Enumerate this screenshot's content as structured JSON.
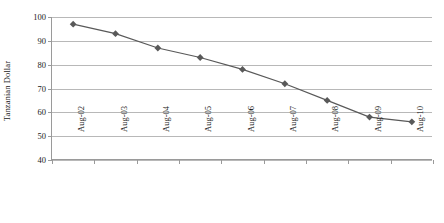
{
  "chart_data": {
    "type": "line",
    "title": "",
    "xlabel": "",
    "ylabel": "Tanzanian Dollar",
    "categories": [
      "Aug-02",
      "Aug-03",
      "Aug-04",
      "Aug-05",
      "Aug-06",
      "Aug-07",
      "Aug-08",
      "Aug-09",
      "Aug-10"
    ],
    "values": [
      97,
      93,
      87,
      83,
      78,
      72,
      65,
      58,
      56
    ],
    "series": [
      {
        "name": "Tanzanian Dollar",
        "values": [
          97,
          93,
          87,
          83,
          78,
          72,
          65,
          58,
          56
        ]
      }
    ],
    "ylim": [
      40,
      100
    ],
    "ytick_labels": [
      "100",
      "90",
      "80",
      "70",
      "60",
      "50",
      "40"
    ],
    "ytick_values": [
      100,
      90,
      80,
      70,
      60,
      50,
      40
    ],
    "grid": true,
    "legend": "none",
    "marker": "diamond",
    "series_color": "#595959",
    "grid_color": "#b8b8b8",
    "axis_color": "#9a9a9a"
  }
}
